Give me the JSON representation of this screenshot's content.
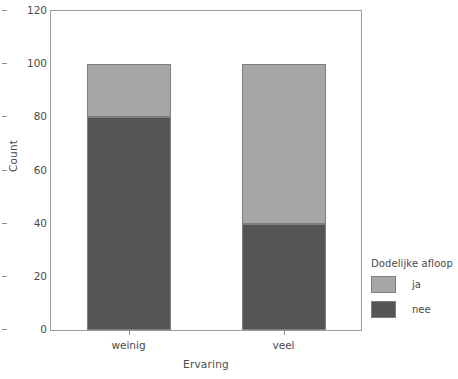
{
  "chart_data": {
    "type": "bar",
    "subtype": "stacked-bar",
    "title": "",
    "xlabel": "Ervaring",
    "ylabel": "Count",
    "categories": [
      "weinig",
      "veel"
    ],
    "series": [
      {
        "name": "ja",
        "values": [
          20,
          60
        ],
        "color": "#a6a6a6"
      },
      {
        "name": "nee",
        "values": [
          80,
          40
        ],
        "color": "#555555"
      }
    ],
    "stack_order": [
      "nee",
      "ja"
    ],
    "totals": [
      100,
      100
    ],
    "ylim": [
      0,
      120
    ],
    "yticks": [
      0,
      20,
      40,
      60,
      80,
      100,
      120
    ],
    "ytick_labels": [
      "0",
      "20",
      "40",
      "60",
      "80",
      "100",
      "120"
    ],
    "grid": false,
    "legend": {
      "title": "Dodelijke afloop",
      "position": "right",
      "entries": [
        {
          "label": "ja",
          "color": "#a6a6a6"
        },
        {
          "label": "nee",
          "color": "#555555"
        }
      ]
    },
    "frame_color": "#9a9a9a",
    "background": "#ffffff"
  }
}
